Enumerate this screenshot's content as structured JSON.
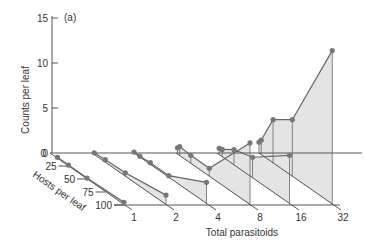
{
  "chart_data": {
    "type": "line",
    "subtype": "3d-waterfall",
    "panel_label": "(a)",
    "title": "",
    "ylabel": "Counts per leaf",
    "xlabel": "Total parasitoids",
    "zlabel": "Hosts per leaf",
    "ylim": [
      0,
      15
    ],
    "y_ticks": [
      "0",
      "5",
      "10",
      "15"
    ],
    "z_ticks": [
      "25",
      "50",
      "75",
      "100"
    ],
    "categories": [
      "1",
      "2",
      "4",
      "8",
      "16",
      "32"
    ],
    "grid": false,
    "legend": null,
    "series": [
      {
        "name": "1",
        "points": [
          {
            "hosts": 10,
            "count": 0.1
          },
          {
            "hosts": 25,
            "count": 0.1
          },
          {
            "hosts": 50,
            "count": 0.1
          },
          {
            "hosts": 100,
            "count": 0.3
          }
        ]
      },
      {
        "name": "2",
        "points": [
          {
            "hosts": 3,
            "count": 0.2
          },
          {
            "hosts": 18,
            "count": 0.3
          },
          {
            "hosts": 45,
            "count": 0.4
          },
          {
            "hosts": 100,
            "count": 1.1
          }
        ]
      },
      {
        "name": "4",
        "points": [
          {
            "hosts": 0,
            "count": 0.1
          },
          {
            "hosts": 8,
            "count": 0.1
          },
          {
            "hosts": 22,
            "count": 0.2
          },
          {
            "hosts": 47,
            "count": 0.2
          },
          {
            "hosts": 98,
            "count": 2.4
          }
        ]
      },
      {
        "name": "8",
        "points": [
          {
            "hosts": 2,
            "count": 0.7
          },
          {
            "hosts": 5,
            "count": 1.0
          },
          {
            "hosts": 20,
            "count": 0.9
          },
          {
            "hosts": 45,
            "count": 0.9
          },
          {
            "hosts": 100,
            "count": 6.9
          }
        ]
      },
      {
        "name": "16",
        "points": [
          {
            "hosts": 3,
            "count": 0.7
          },
          {
            "hosts": 7,
            "count": 0.8
          },
          {
            "hosts": 23,
            "count": 1.7
          },
          {
            "hosts": 48,
            "count": 2.3
          },
          {
            "hosts": 98,
            "count": 5.4
          }
        ]
      },
      {
        "name": "32",
        "points": [
          {
            "hosts": 0,
            "count": 1.2
          },
          {
            "hosts": 3,
            "count": 1.6
          },
          {
            "hosts": 19,
            "count": 4.8
          },
          {
            "hosts": 45,
            "count": 6.3
          },
          {
            "hosts": 99,
            "count": 17.1
          }
        ]
      }
    ],
    "colors": {
      "axis": "#555555",
      "line": "#666666",
      "fill": "#e4e4e4",
      "marker": "#777777",
      "text": "#333333"
    }
  }
}
